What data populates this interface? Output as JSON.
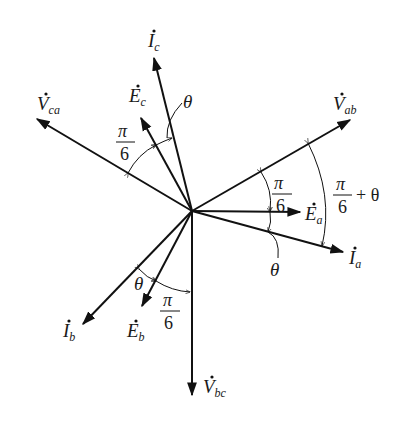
{
  "diagram": {
    "phasors": [
      {
        "id": "Vab",
        "symbol": "V",
        "subscript": "ab",
        "dot": true,
        "angle_deg": 30
      },
      {
        "id": "Ea",
        "symbol": "E",
        "subscript": "a",
        "dot": true,
        "angle_deg": 0
      },
      {
        "id": "Ia",
        "symbol": "I",
        "subscript": "a",
        "dot": true,
        "angle_deg": -15
      },
      {
        "id": "Vbc",
        "symbol": "V",
        "subscript": "bc",
        "dot": true,
        "angle_deg": -90
      },
      {
        "id": "Eb",
        "symbol": "E",
        "subscript": "b",
        "dot": true,
        "angle_deg": -120
      },
      {
        "id": "Ib",
        "symbol": "I",
        "subscript": "b",
        "dot": true,
        "angle_deg": -135
      },
      {
        "id": "Vca",
        "symbol": "V",
        "subscript": "ca",
        "dot": true,
        "angle_deg": 150
      },
      {
        "id": "Ec",
        "symbol": "E",
        "subscript": "c",
        "dot": true,
        "angle_deg": 120
      },
      {
        "id": "Ic",
        "symbol": "I",
        "subscript": "c",
        "dot": true,
        "angle_deg": 105
      }
    ],
    "angles": {
      "pi_over_6": {
        "num": "π",
        "den": "6"
      },
      "pi_over_6_plus_theta": {
        "num": "π",
        "den": "6",
        "suffix": "+ θ"
      },
      "theta": "θ"
    }
  }
}
